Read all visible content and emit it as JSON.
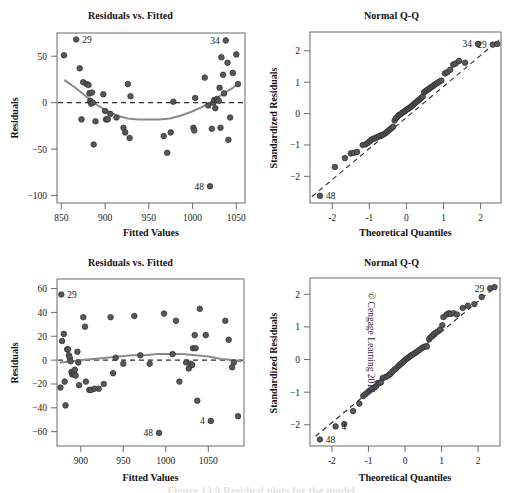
{
  "figure": {
    "copyright": "© Cengage Learning 2013",
    "caption_partial": "Figure 13.9  Residual plots for the model"
  },
  "panels": [
    {
      "id": "top-left",
      "title": "Residuals vs. Fitted",
      "xlabel": "Fitted Values",
      "ylabel": "Residuals"
    },
    {
      "id": "top-right",
      "title": "Normal Q-Q",
      "xlabel": "Theoretical Quantiles",
      "ylabel": "Standardized Residuals"
    },
    {
      "id": "bottom-left",
      "title": "Residuals vs. Fitted",
      "xlabel": "Fitted Values",
      "ylabel": "Residuals"
    },
    {
      "id": "bottom-right",
      "title": "Normal Q-Q",
      "xlabel": "Theoretical Quantiles",
      "ylabel": "Standardized Residuals"
    }
  ],
  "chart_data": [
    {
      "type": "scatter",
      "id": "top-left",
      "title": "Residuals vs. Fitted",
      "xlabel": "Fitted Values",
      "ylabel": "Residuals",
      "xlim": [
        845,
        1060
      ],
      "ylim": [
        -108,
        75
      ],
      "xticks": [
        850,
        900,
        950,
        1000,
        1050
      ],
      "yticks": [
        50,
        0,
        -50,
        -100
      ],
      "grid": false,
      "legend": "none",
      "reference_line": {
        "type": "horizontal",
        "y": 0,
        "style": "dashed"
      },
      "smoother": {
        "type": "loess",
        "points": [
          [
            854,
            24
          ],
          [
            866,
            16
          ],
          [
            878,
            7
          ],
          [
            890,
            -2
          ],
          [
            902,
            -9
          ],
          [
            914,
            -14
          ],
          [
            926,
            -17
          ],
          [
            938,
            -18
          ],
          [
            950,
            -18
          ],
          [
            962,
            -18
          ],
          [
            974,
            -17
          ],
          [
            986,
            -14
          ],
          [
            998,
            -10
          ],
          [
            1010,
            -5
          ],
          [
            1022,
            1
          ],
          [
            1034,
            9
          ],
          [
            1046,
            16
          ],
          [
            1052,
            20
          ]
        ]
      },
      "points": [
        [
          853,
          51
        ],
        [
          867,
          68
        ],
        [
          871,
          37
        ],
        [
          875,
          22
        ],
        [
          879,
          20
        ],
        [
          881,
          19
        ],
        [
          882,
          10
        ],
        [
          883,
          2
        ],
        [
          884,
          -1
        ],
        [
          885,
          11
        ],
        [
          886,
          0
        ],
        [
          887,
          -45
        ],
        [
          873,
          -18
        ],
        [
          889,
          -20
        ],
        [
          898,
          9
        ],
        [
          900,
          -9
        ],
        [
          901,
          -18
        ],
        [
          903,
          -18
        ],
        [
          906,
          -12
        ],
        [
          913,
          -16
        ],
        [
          921,
          -27
        ],
        [
          923,
          -32
        ],
        [
          926,
          20
        ],
        [
          928,
          -38
        ],
        [
          929,
          7
        ],
        [
          967,
          -36
        ],
        [
          971,
          -54
        ],
        [
          975,
          -32
        ],
        [
          978,
          1
        ],
        [
          1001,
          -27
        ],
        [
          1002,
          -30
        ],
        [
          1003,
          5
        ],
        [
          1014,
          27
        ],
        [
          1018,
          -3
        ],
        [
          1020,
          -90
        ],
        [
          1022,
          -28
        ],
        [
          1024,
          0
        ],
        [
          1025,
          3
        ],
        [
          1026,
          -6
        ],
        [
          1028,
          4
        ],
        [
          1030,
          2
        ],
        [
          1031,
          16
        ],
        [
          1032,
          -27
        ],
        [
          1033,
          49
        ],
        [
          1035,
          30
        ],
        [
          1036,
          10
        ],
        [
          1038,
          67
        ],
        [
          1040,
          43
        ],
        [
          1041,
          -40
        ],
        [
          1043,
          -16
        ],
        [
          1046,
          32
        ],
        [
          1050,
          52
        ],
        [
          1052,
          20
        ]
      ],
      "annotations": [
        {
          "label": "29",
          "x": 867,
          "y": 68,
          "side": "right"
        },
        {
          "label": "34",
          "x": 1038,
          "y": 67,
          "side": "left"
        },
        {
          "label": "48",
          "x": 1020,
          "y": -90,
          "side": "left"
        }
      ]
    },
    {
      "type": "scatter",
      "id": "top-right",
      "title": "Normal Q-Q",
      "xlabel": "Theoretical Quantiles",
      "ylabel": "Standardized Residuals",
      "xlim": [
        -2.6,
        2.55
      ],
      "ylim": [
        -2.85,
        2.6
      ],
      "xticks": [
        -2,
        -1,
        0,
        1,
        2
      ],
      "yticks": [
        2,
        1,
        0,
        -1,
        -2
      ],
      "grid": false,
      "legend": "none",
      "reference_line": {
        "type": "qq-diagonal",
        "style": "dashed",
        "p1": [
          -2.55,
          -2.65
        ],
        "p2": [
          2.5,
          2.35
        ]
      },
      "points": [
        [
          -2.33,
          -2.62
        ],
        [
          -1.93,
          -1.7
        ],
        [
          -1.66,
          -1.42
        ],
        [
          -1.5,
          -1.27
        ],
        [
          -1.42,
          -1.25
        ],
        [
          -1.33,
          -1.22
        ],
        [
          -1.18,
          -1.0
        ],
        [
          -1.1,
          -0.98
        ],
        [
          -1.04,
          -0.93
        ],
        [
          -0.99,
          -0.88
        ],
        [
          -0.94,
          -0.83
        ],
        [
          -0.89,
          -0.8
        ],
        [
          -0.84,
          -0.78
        ],
        [
          -0.79,
          -0.75
        ],
        [
          -0.74,
          -0.73
        ],
        [
          -0.7,
          -0.7
        ],
        [
          -0.65,
          -0.68
        ],
        [
          -0.61,
          -0.66
        ],
        [
          -0.56,
          -0.62
        ],
        [
          -0.52,
          -0.58
        ],
        [
          -0.48,
          -0.54
        ],
        [
          -0.44,
          -0.5
        ],
        [
          -0.4,
          -0.46
        ],
        [
          -0.36,
          -0.42
        ],
        [
          -0.32,
          -0.22
        ],
        [
          -0.28,
          -0.15
        ],
        [
          -0.24,
          -0.1
        ],
        [
          -0.2,
          -0.05
        ],
        [
          -0.16,
          -0.02
        ],
        [
          -0.12,
          0.02
        ],
        [
          -0.08,
          0.05
        ],
        [
          -0.04,
          0.08
        ],
        [
          0.0,
          0.12
        ],
        [
          0.04,
          0.15
        ],
        [
          0.08,
          0.18
        ],
        [
          0.12,
          0.22
        ],
        [
          0.16,
          0.26
        ],
        [
          0.2,
          0.3
        ],
        [
          0.24,
          0.34
        ],
        [
          0.28,
          0.38
        ],
        [
          0.32,
          0.42
        ],
        [
          0.36,
          0.46
        ],
        [
          0.4,
          0.5
        ],
        [
          0.44,
          0.54
        ],
        [
          0.48,
          0.68
        ],
        [
          0.52,
          0.72
        ],
        [
          0.56,
          0.75
        ],
        [
          0.6,
          0.78
        ],
        [
          0.64,
          0.82
        ],
        [
          0.68,
          0.85
        ],
        [
          0.72,
          0.88
        ],
        [
          0.76,
          0.92
        ],
        [
          0.8,
          0.95
        ],
        [
          0.84,
          0.98
        ],
        [
          0.89,
          1.02
        ],
        [
          0.94,
          1.05
        ],
        [
          1.04,
          1.28
        ],
        [
          1.1,
          1.32
        ],
        [
          1.18,
          1.4
        ],
        [
          1.26,
          1.56
        ],
        [
          1.33,
          1.6
        ],
        [
          1.42,
          1.68
        ],
        [
          1.58,
          1.62
        ],
        [
          1.93,
          2.22
        ],
        [
          2.33,
          2.2
        ],
        [
          2.45,
          2.22
        ]
      ],
      "annotations": [
        {
          "label": "48",
          "x": -2.33,
          "y": -2.62,
          "side": "right"
        },
        {
          "label": "34",
          "x": 1.93,
          "y": 2.22,
          "side": "left"
        },
        {
          "label": "29",
          "x": 2.33,
          "y": 2.2,
          "side": "left"
        }
      ]
    },
    {
      "type": "scatter",
      "id": "bottom-left",
      "title": "Residuals vs. Fitted",
      "xlabel": "Fitted Values",
      "ylabel": "Residuals",
      "xlim": [
        872,
        1092
      ],
      "ylim": [
        -72,
        68
      ],
      "xticks": [
        900,
        950,
        1000,
        1050
      ],
      "yticks": [
        60,
        40,
        20,
        0,
        -20,
        -40,
        -60
      ],
      "grid": false,
      "legend": "none",
      "reference_line": {
        "type": "horizontal",
        "y": 0,
        "style": "dashed"
      },
      "smoother": {
        "type": "loess",
        "points": [
          [
            876,
            -2
          ],
          [
            890,
            -1
          ],
          [
            900,
            0
          ],
          [
            915,
            1
          ],
          [
            930,
            2
          ],
          [
            945,
            3
          ],
          [
            960,
            4
          ],
          [
            975,
            4
          ],
          [
            990,
            5
          ],
          [
            1005,
            5
          ],
          [
            1020,
            5
          ],
          [
            1035,
            4
          ],
          [
            1050,
            3
          ],
          [
            1065,
            1
          ],
          [
            1080,
            0
          ],
          [
            1088,
            -1
          ]
        ]
      },
      "points": [
        [
          877,
          55
        ],
        [
          876,
          -23
        ],
        [
          878,
          16
        ],
        [
          880,
          22
        ],
        [
          881,
          -18
        ],
        [
          882,
          -38
        ],
        [
          884,
          9
        ],
        [
          885,
          9
        ],
        [
          886,
          4
        ],
        [
          887,
          2
        ],
        [
          888,
          -1
        ],
        [
          889,
          -10
        ],
        [
          890,
          -12
        ],
        [
          891,
          -11
        ],
        [
          892,
          -11
        ],
        [
          893,
          -8
        ],
        [
          894,
          -13
        ],
        [
          896,
          7
        ],
        [
          897,
          -2
        ],
        [
          898,
          -21
        ],
        [
          903,
          36
        ],
        [
          905,
          28
        ],
        [
          906,
          -18
        ],
        [
          910,
          -25
        ],
        [
          912,
          -25
        ],
        [
          916,
          -24
        ],
        [
          921,
          -24
        ],
        [
          927,
          -20
        ],
        [
          935,
          36
        ],
        [
          938,
          -11
        ],
        [
          941,
          2
        ],
        [
          950,
          -3
        ],
        [
          963,
          37
        ],
        [
          970,
          4
        ],
        [
          981,
          -3
        ],
        [
          992,
          -61
        ],
        [
          998,
          39
        ],
        [
          1008,
          5
        ],
        [
          1012,
          33
        ],
        [
          1016,
          -18
        ],
        [
          1024,
          -2
        ],
        [
          1027,
          -7
        ],
        [
          1029,
          -3
        ],
        [
          1031,
          -4
        ],
        [
          1032,
          10
        ],
        [
          1034,
          21
        ],
        [
          1035,
          10
        ],
        [
          1037,
          -34
        ],
        [
          1040,
          43
        ],
        [
          1047,
          21
        ],
        [
          1053,
          -51
        ],
        [
          1070,
          33
        ],
        [
          1074,
          17
        ],
        [
          1078,
          -6
        ],
        [
          1080,
          -2
        ],
        [
          1085,
          -47
        ]
      ],
      "annotations": [
        {
          "label": "29",
          "x": 877,
          "y": 55,
          "side": "right"
        },
        {
          "label": "48",
          "x": 992,
          "y": -61,
          "side": "left"
        },
        {
          "label": "4",
          "x": 1053,
          "y": -51,
          "side": "left"
        }
      ]
    },
    {
      "type": "scatter",
      "id": "bottom-right",
      "title": "Normal Q-Q",
      "xlabel": "Theoretical Quantiles",
      "ylabel": "Standardized Residuals",
      "xlim": [
        -2.6,
        2.6
      ],
      "ylim": [
        -2.65,
        2.5
      ],
      "xticks": [
        -2,
        -1,
        0,
        1,
        2
      ],
      "yticks": [
        2,
        1,
        0,
        -1,
        -2
      ],
      "grid": false,
      "legend": "none",
      "reference_line": {
        "type": "qq-diagonal",
        "style": "dashed",
        "p1": [
          -2.45,
          -2.35
        ],
        "p2": [
          2.5,
          2.25
        ]
      },
      "points": [
        [
          -2.33,
          -2.45
        ],
        [
          -1.9,
          -2.05
        ],
        [
          -1.66,
          -1.98
        ],
        [
          -1.42,
          -1.58
        ],
        [
          -1.25,
          -1.35
        ],
        [
          -1.14,
          -1.12
        ],
        [
          -1.08,
          -1.06
        ],
        [
          -1.02,
          -1.0
        ],
        [
          -0.96,
          -0.95
        ],
        [
          -0.9,
          -0.9
        ],
        [
          -0.84,
          -0.86
        ],
        [
          -0.79,
          -0.82
        ],
        [
          -0.74,
          -0.72
        ],
        [
          -0.7,
          -0.72
        ],
        [
          -0.66,
          -0.7
        ],
        [
          -0.61,
          -0.57
        ],
        [
          -0.56,
          -0.55
        ],
        [
          -0.5,
          -0.52
        ],
        [
          -0.45,
          -0.48
        ],
        [
          -0.4,
          -0.44
        ],
        [
          -0.35,
          -0.38
        ],
        [
          -0.3,
          -0.32
        ],
        [
          -0.25,
          -0.28
        ],
        [
          -0.2,
          -0.22
        ],
        [
          -0.16,
          -0.18
        ],
        [
          -0.12,
          -0.14
        ],
        [
          -0.08,
          -0.1
        ],
        [
          -0.04,
          -0.06
        ],
        [
          0.0,
          -0.02
        ],
        [
          0.04,
          0.02
        ],
        [
          0.08,
          0.05
        ],
        [
          0.12,
          0.08
        ],
        [
          0.16,
          0.12
        ],
        [
          0.2,
          0.15
        ],
        [
          0.25,
          0.18
        ],
        [
          0.3,
          0.22
        ],
        [
          0.35,
          0.26
        ],
        [
          0.4,
          0.3
        ],
        [
          0.45,
          0.34
        ],
        [
          0.5,
          0.38
        ],
        [
          0.55,
          0.4
        ],
        [
          0.6,
          0.4
        ],
        [
          0.66,
          0.62
        ],
        [
          0.7,
          0.68
        ],
        [
          0.74,
          0.72
        ],
        [
          0.79,
          0.78
        ],
        [
          0.84,
          0.82
        ],
        [
          0.9,
          0.86
        ],
        [
          0.96,
          0.92
        ],
        [
          1.02,
          1.05
        ],
        [
          1.05,
          1.3
        ],
        [
          1.14,
          1.38
        ],
        [
          1.2,
          1.42
        ],
        [
          1.25,
          1.4
        ],
        [
          1.33,
          1.42
        ],
        [
          1.42,
          1.38
        ],
        [
          1.58,
          1.58
        ],
        [
          1.72,
          1.65
        ],
        [
          1.9,
          1.7
        ],
        [
          2.1,
          1.92
        ],
        [
          2.33,
          2.18
        ],
        [
          2.45,
          2.22
        ]
      ],
      "annotations": [
        {
          "label": "48",
          "x": -2.33,
          "y": -2.45,
          "side": "right"
        },
        {
          "label": "4",
          "x": -1.9,
          "y": -2.05,
          "side": "right"
        },
        {
          "label": "29",
          "x": 2.33,
          "y": 2.18,
          "side": "left"
        }
      ]
    }
  ]
}
